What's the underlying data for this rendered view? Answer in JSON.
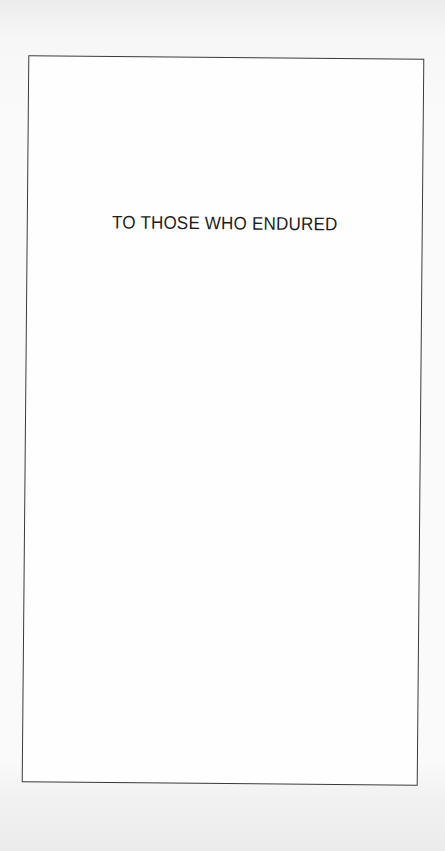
{
  "page": {
    "type": "dedication",
    "dedication_text": "TO THOSE WHO ENDURED",
    "colors": {
      "paper": "#fafafa",
      "frame_border": "#3a3a3a",
      "text": "#1c1c1c"
    }
  }
}
